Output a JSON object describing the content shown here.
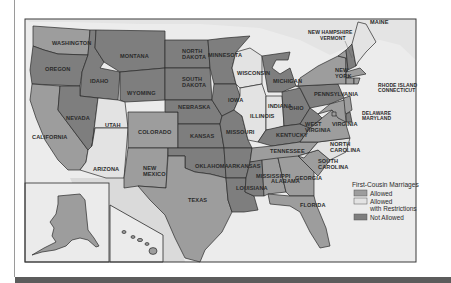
{
  "map": {
    "colors": {
      "allowed": "#9d9d9d",
      "restricted": "#e3e3e3",
      "not_allowed": "#7e7e7e",
      "water": "#e9e9e9",
      "foreign": "#d6d6d6",
      "frame": "#3a3a3a"
    },
    "states": {
      "washington": {
        "label": "WASHINGTON",
        "status": "allowed"
      },
      "oregon": {
        "label": "OREGON",
        "status": "not_allowed"
      },
      "california": {
        "label": "CALIFORNIA",
        "status": "allowed"
      },
      "idaho": {
        "label": "IDAHO",
        "status": "not_allowed"
      },
      "nevada": {
        "label": "NEVADA",
        "status": "not_allowed"
      },
      "montana": {
        "label": "MONTANA",
        "status": "not_allowed"
      },
      "wyoming": {
        "label": "WYOMING",
        "status": "not_allowed"
      },
      "utah": {
        "label": "UTAH",
        "status": "restricted"
      },
      "arizona": {
        "label": "ARIZONA",
        "status": "restricted"
      },
      "colorado": {
        "label": "COLORADO",
        "status": "allowed"
      },
      "new_mexico": {
        "label_lines": [
          "NEW",
          "MEXICO"
        ],
        "status": "allowed"
      },
      "north_dakota": {
        "label_lines": [
          "NORTH",
          "DAKOTA"
        ],
        "status": "not_allowed"
      },
      "south_dakota": {
        "label_lines": [
          "SOUTH",
          "DAKOTA"
        ],
        "status": "not_allowed"
      },
      "nebraska": {
        "label": "NEBRASKA",
        "status": "not_allowed"
      },
      "kansas": {
        "label": "KANSAS",
        "status": "not_allowed"
      },
      "oklahoma": {
        "label": "OKLAHOMA",
        "status": "not_allowed"
      },
      "texas": {
        "label": "TEXAS",
        "status": "allowed"
      },
      "minnesota": {
        "label": "MINNESOTA",
        "status": "not_allowed"
      },
      "iowa": {
        "label": "IOWA",
        "status": "not_allowed"
      },
      "missouri": {
        "label": "MISSOURI",
        "status": "not_allowed"
      },
      "arkansas": {
        "label": "ARKANSAS",
        "status": "not_allowed"
      },
      "louisiana": {
        "label": "LOUISIANA",
        "status": "not_allowed"
      },
      "wisconsin": {
        "label": "WISCONSIN",
        "status": "restricted"
      },
      "illinois": {
        "label": "ILLINOIS",
        "status": "restricted"
      },
      "michigan": {
        "label": "MICHIGAN",
        "status": "not_allowed"
      },
      "indiana": {
        "label": "INDIANA",
        "status": "restricted"
      },
      "ohio": {
        "label": "OHIO",
        "status": "not_allowed"
      },
      "kentucky": {
        "label": "KENTUCKY",
        "status": "not_allowed"
      },
      "tennessee": {
        "label": "TENNESSEE",
        "status": "allowed"
      },
      "mississippi": {
        "label": "MISSISSIPPI",
        "status": "not_allowed"
      },
      "alabama": {
        "label": "ALABAMA",
        "status": "allowed"
      },
      "georgia": {
        "label": "GEORGIA",
        "status": "allowed"
      },
      "florida": {
        "label": "FLORIDA",
        "status": "allowed"
      },
      "south_carolina": {
        "label_lines": [
          "SOUTH",
          "CAROLINA"
        ],
        "status": "allowed"
      },
      "north_carolina": {
        "label_lines": [
          "NORTH",
          "CAROLINA"
        ],
        "status": "restricted"
      },
      "virginia": {
        "label": "VIRGINIA",
        "status": "allowed"
      },
      "west_virginia": {
        "label_lines": [
          "WEST",
          "VIRGINIA"
        ],
        "status": "not_allowed"
      },
      "pennsylvania": {
        "label": "PENNSYLVANIA",
        "status": "not_allowed"
      },
      "new_york": {
        "label_lines": [
          "NEW",
          "YORK"
        ],
        "status": "allowed"
      },
      "vermont": {
        "label": "VERMONT",
        "status": "allowed"
      },
      "new_hampshire": {
        "label": "NEW HAMPSHIRE",
        "status": "not_allowed"
      },
      "maine": {
        "label": "MAINE",
        "status": "restricted"
      },
      "massachusetts": {
        "label": "MASSACHUSETTS",
        "status": "allowed"
      },
      "rhode_island": {
        "label": "RHODE ISLAND",
        "status": "allowed"
      },
      "connecticut": {
        "label": "CONNECTICUT",
        "status": "allowed"
      },
      "new_jersey": {
        "label": "NEW JERSEY",
        "status": "allowed"
      },
      "delaware": {
        "label": "DELAWARE",
        "status": "not_allowed"
      },
      "maryland": {
        "label": "MARYLAND",
        "status": "allowed"
      },
      "dc": {
        "label": "D.C.",
        "status": "allowed"
      },
      "alaska": {
        "label": "ALASKA",
        "status": "allowed"
      },
      "hawaii": {
        "label": "HAWAII",
        "status": "allowed"
      }
    },
    "callout_labels": {
      "nh_vt_line1": "NEW HAMPSHIRE",
      "nh_vt_line2": "VERMONT",
      "ri_ct_line1": "RHODE ISLAND",
      "ri_ct_line2": "CONNECTICUT",
      "de_md_line1": "DELAWARE",
      "de_md_line2": "MARYLAND"
    },
    "legend": {
      "title": "First-Cousin Marriages",
      "items": [
        {
          "key": "allowed",
          "label_lines": [
            "Allowed"
          ]
        },
        {
          "key": "restricted",
          "label_lines": [
            "Allowed",
            "with Restrictions"
          ]
        },
        {
          "key": "not_allowed",
          "label_lines": [
            "Not Allowed"
          ]
        }
      ]
    }
  }
}
